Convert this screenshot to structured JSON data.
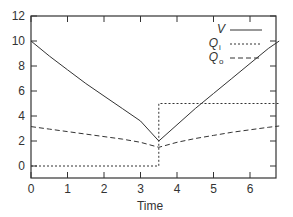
{
  "chart_data": {
    "type": "line",
    "title": "",
    "xlabel": "Time",
    "ylabel": "",
    "xlim": [
      0,
      6.8
    ],
    "ylim": [
      -1,
      12
    ],
    "xticks": [
      0,
      1,
      2,
      3,
      4,
      5,
      6
    ],
    "yticks": [
      0,
      2,
      4,
      6,
      8,
      10,
      12
    ],
    "grid": false,
    "legend_position": "upper right",
    "series": [
      {
        "name": "V",
        "style": "solid",
        "x": [
          0,
          0.5,
          1,
          1.5,
          2,
          2.5,
          3,
          3.5,
          4,
          4.5,
          5,
          5.5,
          6,
          6.5,
          6.8
        ],
        "y": [
          10,
          8.8,
          7.7,
          6.6,
          5.6,
          4.6,
          3.6,
          2.0,
          3.3,
          4.6,
          5.8,
          7.0,
          8.2,
          9.4,
          10.0
        ]
      },
      {
        "name": "Q_i",
        "style": "dotted",
        "x": [
          0,
          3.5,
          3.5,
          6.8
        ],
        "y": [
          0,
          0,
          5,
          5
        ]
      },
      {
        "name": "Q_o",
        "style": "dashed",
        "x": [
          0,
          0.5,
          1,
          1.5,
          2,
          2.5,
          3,
          3.5,
          4,
          4.5,
          5,
          5.5,
          6,
          6.5,
          6.8
        ],
        "y": [
          3.15,
          2.95,
          2.75,
          2.55,
          2.35,
          2.15,
          1.9,
          1.5,
          1.9,
          2.2,
          2.45,
          2.7,
          2.9,
          3.1,
          3.2
        ]
      }
    ]
  },
  "legend": {
    "v": "V",
    "qi_main": "Q",
    "qi_sub": "i",
    "qo_main": "Q",
    "qo_sub": "o"
  },
  "axes": {
    "xlabel": "Time",
    "xtick_labels": [
      "0",
      "1",
      "2",
      "3",
      "4",
      "5",
      "6"
    ],
    "ytick_labels": [
      "0",
      "2",
      "4",
      "6",
      "8",
      "10",
      "12"
    ]
  }
}
